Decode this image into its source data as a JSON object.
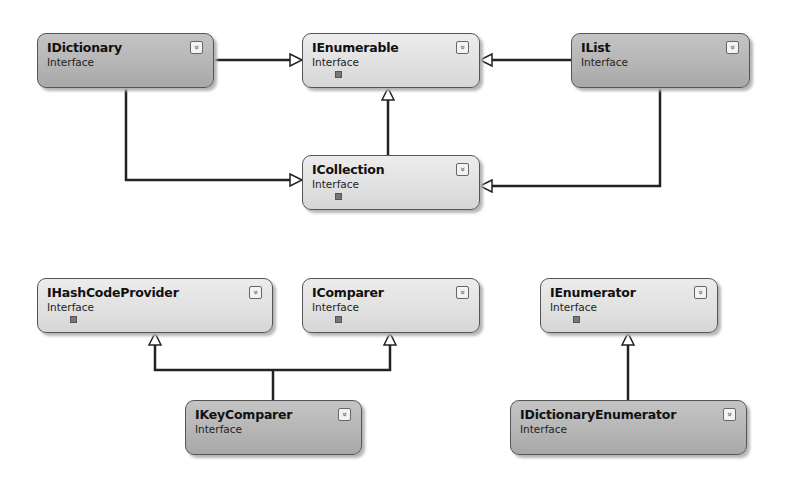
{
  "diagram": {
    "type": "class-diagram",
    "nodes": [
      {
        "id": "idictionary",
        "name": "IDictionary",
        "kind": "Interface",
        "has_lock": false
      },
      {
        "id": "ienumerable",
        "name": "IEnumerable",
        "kind": "Interface",
        "has_lock": true
      },
      {
        "id": "ilist",
        "name": "IList",
        "kind": "Interface",
        "has_lock": false
      },
      {
        "id": "icollection",
        "name": "ICollection",
        "kind": "Interface",
        "has_lock": true
      },
      {
        "id": "ihashcodeprovider",
        "name": "IHashCodeProvider",
        "kind": "Interface",
        "has_lock": true
      },
      {
        "id": "icomparer",
        "name": "IComparer",
        "kind": "Interface",
        "has_lock": true
      },
      {
        "id": "ienumerator",
        "name": "IEnumerator",
        "kind": "Interface",
        "has_lock": true
      },
      {
        "id": "ikeycomparer",
        "name": "IKeyComparer",
        "kind": "Interface",
        "has_lock": false
      },
      {
        "id": "idictionaryenumerator",
        "name": "IDictionaryEnumerator",
        "kind": "Interface",
        "has_lock": false
      }
    ],
    "edges": [
      {
        "from": "IDictionary",
        "to": "IEnumerable",
        "type": "inherits"
      },
      {
        "from": "IList",
        "to": "IEnumerable",
        "type": "inherits"
      },
      {
        "from": "ICollection",
        "to": "IEnumerable",
        "type": "inherits"
      },
      {
        "from": "IDictionary",
        "to": "ICollection",
        "type": "inherits"
      },
      {
        "from": "IList",
        "to": "ICollection",
        "type": "inherits"
      },
      {
        "from": "IKeyComparer",
        "to": "IHashCodeProvider",
        "type": "inherits"
      },
      {
        "from": "IKeyComparer",
        "to": "IComparer",
        "type": "inherits"
      },
      {
        "from": "IDictionaryEnumerator",
        "to": "IEnumerator",
        "type": "inherits"
      }
    ],
    "expand_icon": "double-chevron-down-icon",
    "colors": {
      "line": "#222222",
      "box_border": "#555555"
    }
  }
}
